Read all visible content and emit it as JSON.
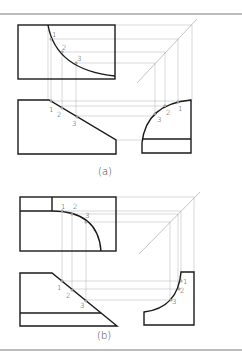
{
  "figure": {
    "panels": [
      {
        "caption": "(a)",
        "point_labels": [
          "1",
          "2",
          "3"
        ],
        "views": [
          "top-view",
          "front-view",
          "side-view"
        ]
      },
      {
        "caption": "(b)",
        "point_labels": [
          "1",
          "2",
          "3"
        ],
        "views": [
          "top-view",
          "front-view",
          "side-view"
        ]
      }
    ]
  },
  "colors": {
    "object_line": "#1a1a1a",
    "projection_line": "#b0b0b0",
    "background": "#ffffff"
  }
}
